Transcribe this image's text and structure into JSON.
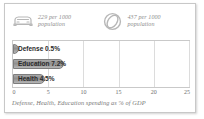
{
  "card": {
    "background": "#ffffff",
    "border_color": "#c8c8c8"
  },
  "stats": [
    {
      "icon": "car-icon",
      "value": "229",
      "text": "229 per 1000\npopulation"
    },
    {
      "icon": "ball-icon",
      "value": "437",
      "text": "437 per 1000\npopulation"
    }
  ],
  "chart_data": {
    "type": "bar",
    "orientation": "horizontal",
    "title": "",
    "caption": "Defense, Health, Education spending as % of GDP",
    "categories": [
      "Defense",
      "Education",
      "Health"
    ],
    "values": [
      0.5,
      7.2,
      4.5
    ],
    "bar_labels": [
      "Defense 0.5%",
      "Education 7.2%",
      "Health 4.5%"
    ],
    "xlabel": "",
    "ylabel": "",
    "xlim": [
      0,
      25
    ],
    "ticks": [
      "0",
      "5",
      "10",
      "15",
      "20",
      "25"
    ],
    "tick_values": [
      0,
      5,
      10,
      15,
      20,
      25
    ],
    "grid": true,
    "legend": false,
    "bar_color": "#999999",
    "bar_border_color": "#7e7e7e",
    "grid_color": "#dcdcdc",
    "axis_label_color": "#6e6e6e"
  }
}
